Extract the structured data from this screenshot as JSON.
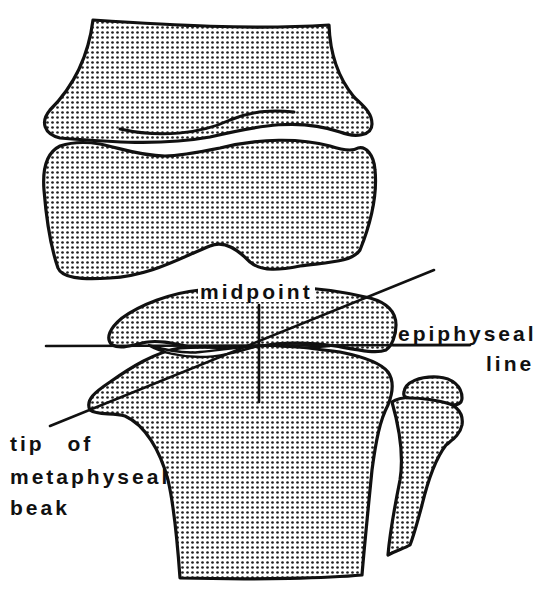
{
  "figure": {
    "type": "anatomical line drawing",
    "fill_style": "stippled halftone dots",
    "colors": {
      "ink": "#111111",
      "background": "#ffffff"
    }
  },
  "labels": {
    "midpoint": "midpoint",
    "epiphyseal_line_1": "epiphyseal",
    "epiphyseal_line_2": "line",
    "tip_line_1": "tip of",
    "tip_line_2": "metaphyseal",
    "tip_line_3": "beak"
  }
}
